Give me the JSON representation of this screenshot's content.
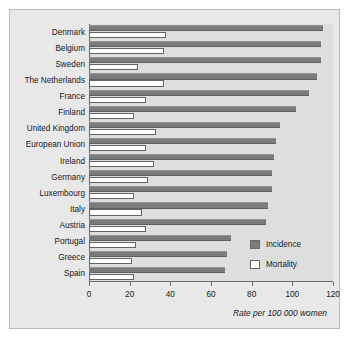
{
  "figure": {
    "footnote": "Rate per 100 000 women",
    "panel_bg": "#e8e8e8",
    "plot_bg": "#dededd"
  },
  "legend": {
    "position": "inside-bottom-right",
    "entries": [
      {
        "label": "Incidence",
        "color": "#7b7b7b",
        "swatch": "incidence-swatch"
      },
      {
        "label": "Mortality",
        "color": "#ffffff",
        "swatch": "mortality-swatch"
      }
    ]
  },
  "chart_data": {
    "type": "bar",
    "orientation": "horizontal",
    "title": "",
    "subtitle": "",
    "xlabel": "Rate per 100 000 women",
    "ylabel": "",
    "xlim": [
      0,
      120
    ],
    "xticks": [
      0,
      20,
      40,
      60,
      80,
      100,
      120
    ],
    "xticklabels": [
      "0",
      "20",
      "40",
      "60",
      "80",
      "100",
      "120"
    ],
    "grid": false,
    "legend_position": "inside-bottom-right",
    "categories": [
      "Denmark",
      "Belgium",
      "Sweden",
      "The Netherlands",
      "France",
      "Finland",
      "United Kingdom",
      "European Union",
      "Ireland",
      "Germany",
      "Luxembourg",
      "Italy",
      "Austria",
      "Portugal",
      "Greece",
      "Spain"
    ],
    "series": [
      {
        "name": "Incidence",
        "color": "#7b7b7b",
        "values": [
          115,
          114,
          114,
          112,
          108,
          102,
          94,
          92,
          91,
          90,
          90,
          88,
          87,
          70,
          68,
          67
        ]
      },
      {
        "name": "Mortality",
        "color": "#ffffff",
        "values": [
          38,
          37,
          24,
          37,
          28,
          22,
          33,
          28,
          32,
          29,
          22,
          26,
          28,
          23,
          21,
          22
        ]
      }
    ]
  }
}
